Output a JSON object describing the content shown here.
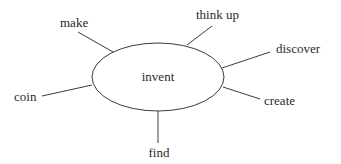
{
  "diagram": {
    "type": "word-web",
    "center": {
      "label": "invent",
      "cx": 158,
      "cy": 77,
      "rx": 66,
      "ry": 34
    },
    "branches": [
      {
        "label": "make",
        "x1": 113,
        "y1": 52,
        "x2": 78,
        "y2": 32,
        "tx": 60,
        "ty": 27,
        "anchor": "start"
      },
      {
        "label": "think up",
        "x1": 187,
        "y1": 45,
        "x2": 212,
        "y2": 26,
        "tx": 196,
        "ty": 19,
        "anchor": "start"
      },
      {
        "label": "discover",
        "x1": 222,
        "y1": 68,
        "x2": 270,
        "y2": 52,
        "tx": 276,
        "ty": 53,
        "anchor": "start"
      },
      {
        "label": "coin",
        "x1": 92,
        "y1": 85,
        "x2": 42,
        "y2": 96,
        "tx": 14,
        "ty": 101,
        "anchor": "start"
      },
      {
        "label": "create",
        "x1": 223,
        "y1": 87,
        "x2": 260,
        "y2": 99,
        "tx": 264,
        "ty": 105,
        "anchor": "start"
      },
      {
        "label": "find",
        "x1": 158,
        "y1": 111,
        "x2": 158,
        "y2": 143,
        "tx": 159,
        "ty": 157,
        "anchor": "middle"
      }
    ],
    "colors": {
      "stroke": "#3a3a3a",
      "text": "#2a2a2a"
    }
  }
}
